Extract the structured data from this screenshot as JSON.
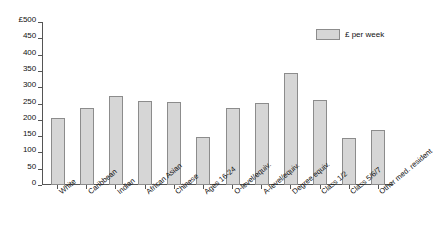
{
  "chart_data": {
    "type": "bar",
    "title": "",
    "xlabel": "",
    "ylabel": "£500",
    "ylim": [
      0,
      500
    ],
    "yticks": [
      0,
      50,
      100,
      150,
      200,
      250,
      300,
      350,
      400,
      450,
      500
    ],
    "ytick_labels": [
      "0",
      "50",
      "100",
      "150",
      "200",
      "250",
      "300",
      "350",
      "400",
      "450",
      "£500"
    ],
    "grid": false,
    "legend_position": "top-right",
    "legend": [
      "£ per week"
    ],
    "categories": [
      "White",
      "Caribbean",
      "Indian",
      "African Asian",
      "Chinese",
      "Ages 16-24",
      "O-level/equiv.",
      "A-level/equiv.",
      "Degree equiv.",
      "Class 1/2",
      "Class 5/6/7",
      "Other med. resident"
    ],
    "values": [
      205,
      235,
      272,
      257,
      255,
      147,
      235,
      253,
      344,
      262,
      145,
      170
    ],
    "series": [
      {
        "name": "£ per week",
        "values": [
          205,
          235,
          272,
          257,
          255,
          147,
          235,
          253,
          344,
          262,
          145,
          170
        ]
      }
    ],
    "bar_color": "#d6d6d6",
    "bar_border_color": "#8c8c8c",
    "axis_color": "#555555"
  },
  "legend": {
    "label": "£ per week"
  }
}
